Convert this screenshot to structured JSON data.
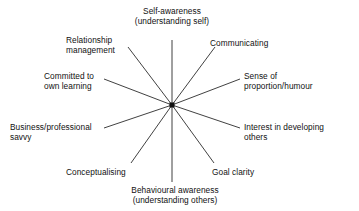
{
  "diagram": {
    "type": "radial-spoke",
    "title": "",
    "background_color": "#ffffff",
    "line_color": "#2b2b2b",
    "hub_color": "#111111",
    "text_color": "#111111",
    "center": {
      "x": 172,
      "y": 105
    },
    "hub": {
      "shape": "square",
      "size": 5
    },
    "spoke_count": 10,
    "labels": {
      "self_awareness": {
        "line1": "Self-awareness",
        "line2": "(understanding self)"
      },
      "relationship_management": {
        "line1": "Relationship",
        "line2": "management"
      },
      "communicating": {
        "line1": "Communicating",
        "line2": ""
      },
      "committed_to_own_learning": {
        "line1": "Committed to",
        "line2": "own learning"
      },
      "sense_of_proportion": {
        "line1": "Sense of",
        "line2": "proportion/humour"
      },
      "business_professional_savvy": {
        "line1": "Business/professional",
        "line2": "savvy"
      },
      "interest_in_developing_others": {
        "line1": "Interest in developing",
        "line2": "others"
      },
      "conceptualising": {
        "line1": "Conceptualising",
        "line2": ""
      },
      "goal_clarity": {
        "line1": "Goal clarity",
        "line2": ""
      },
      "behavioural_awareness": {
        "line1": "Behavioural awareness",
        "line2": "(understanding others)"
      }
    },
    "spokes": [
      {
        "name": "self-awareness",
        "x2": 172,
        "y2": 40
      },
      {
        "name": "relationship-management",
        "x2": 128,
        "y2": 47
      },
      {
        "name": "communicating",
        "x2": 215,
        "y2": 47
      },
      {
        "name": "committed-to-own-learning",
        "x2": 104,
        "y2": 79
      },
      {
        "name": "sense-of-proportion-humour",
        "x2": 240,
        "y2": 79
      },
      {
        "name": "business-professional-savvy",
        "x2": 104,
        "y2": 128
      },
      {
        "name": "interest-in-developing-others",
        "x2": 240,
        "y2": 128
      },
      {
        "name": "conceptualising",
        "x2": 131,
        "y2": 163
      },
      {
        "name": "goal-clarity",
        "x2": 214,
        "y2": 163
      },
      {
        "name": "behavioural-awareness",
        "x2": 172,
        "y2": 182
      }
    ]
  }
}
